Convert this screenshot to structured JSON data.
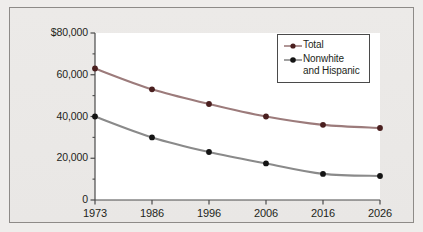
{
  "chart_data": {
    "type": "line",
    "title": "",
    "subtitle": "",
    "xlabel": "",
    "ylabel": "",
    "categories": [
      "1973",
      "1986",
      "1996",
      "2006",
      "2016",
      "2026"
    ],
    "x_tick_labels": [
      "1973",
      "1986",
      "1996",
      "2006",
      "2016",
      "2026"
    ],
    "y_tick_labels": [
      "$80,000",
      "60,000",
      "40,000",
      "20,000",
      "0"
    ],
    "y_tick_values": [
      80000,
      60000,
      40000,
      20000,
      0
    ],
    "ylim": [
      0,
      80000
    ],
    "y_minor_ticks": [
      10000,
      30000,
      50000,
      70000
    ],
    "grid": false,
    "legend_position": "top-right",
    "series": [
      {
        "name": "Total",
        "color": "#9c7b7b",
        "marker_color": "#4a1f1f",
        "values": [
          63000,
          53000,
          46000,
          40000,
          36000,
          34500
        ]
      },
      {
        "name": "Nonwhite and Hispanic",
        "color": "#8a8a8a",
        "marker_color": "#141414",
        "values": [
          40000,
          30000,
          23000,
          17500,
          12500,
          11500
        ]
      }
    ]
  },
  "legend": {
    "items": [
      {
        "label": "Total",
        "line2": ""
      },
      {
        "label": "Nonwhite",
        "line2": "and Hispanic"
      }
    ]
  },
  "colors": {
    "background": "#efedeb",
    "plot_background": "#ffffff",
    "frame_border": "#8e8b88",
    "axis": "#4a4a4a",
    "total_line": "#9c7b7b",
    "nonwhite_line": "#8a8a8a",
    "text": "#231f20"
  }
}
